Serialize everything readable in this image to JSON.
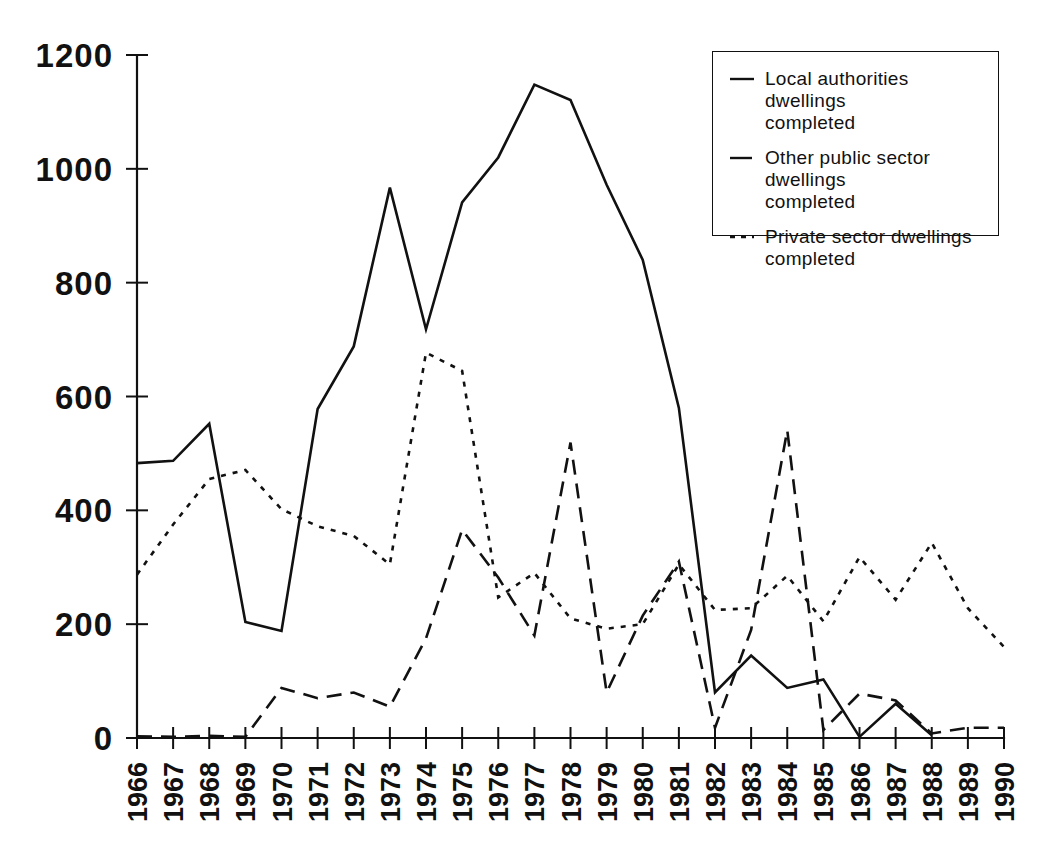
{
  "chart_data": {
    "type": "line",
    "title": "",
    "subtitle": "",
    "xlabel": "",
    "ylabel": "",
    "grid": false,
    "legend_position": "top-right",
    "ylim": [
      0,
      1200
    ],
    "ytick_labels": [
      "0",
      "200",
      "400",
      "600",
      "800",
      "1000",
      "1200"
    ],
    "ytick_values": [
      0,
      200,
      400,
      600,
      800,
      1000,
      1200
    ],
    "categories": [
      "1966",
      "1967",
      "1968",
      "1969",
      "1970",
      "1971",
      "1972",
      "1973",
      "1974",
      "1975",
      "1976",
      "1977",
      "1978",
      "1979",
      "1980",
      "1981",
      "1982",
      "1983",
      "1984",
      "1985",
      "1986",
      "1987",
      "1988",
      "1989",
      "1990"
    ],
    "series": [
      {
        "name": "Local authorities dwellings completed",
        "style": "solid",
        "values": [
          483,
          487,
          552,
          204,
          188,
          578,
          688,
          967,
          718,
          941,
          1020,
          1148,
          1121,
          972,
          840,
          580,
          80,
          145,
          88,
          103,
          2,
          60,
          5,
          null,
          null
        ]
      },
      {
        "name": "Other public sector dwellings completed",
        "style": "dashed",
        "values": [
          3,
          2,
          4,
          2,
          88,
          70,
          80,
          55,
          175,
          366,
          282,
          180,
          519,
          80,
          215,
          310,
          18,
          190,
          541,
          14,
          78,
          66,
          8,
          18,
          18
        ]
      },
      {
        "name": "Private sector dwellings completed",
        "style": "dotted",
        "values": [
          287,
          375,
          455,
          471,
          402,
          372,
          355,
          305,
          677,
          645,
          247,
          290,
          210,
          192,
          200,
          305,
          225,
          228,
          285,
          205,
          318,
          243,
          343,
          228,
          160
        ]
      }
    ]
  },
  "legend": {
    "items": [
      {
        "swatch": "solid-line-swatch",
        "label": "Local authorities dwellings\ncompleted"
      },
      {
        "swatch": "dashed-line-swatch",
        "label": "Other public sector dwellings\ncompleted"
      },
      {
        "swatch": "dotted-line-swatch",
        "label": "Private sector dwellings\ncompleted"
      }
    ]
  },
  "caption": {
    "text": ""
  },
  "colors": {
    "ink": "#111111",
    "background": "#ffffff"
  }
}
